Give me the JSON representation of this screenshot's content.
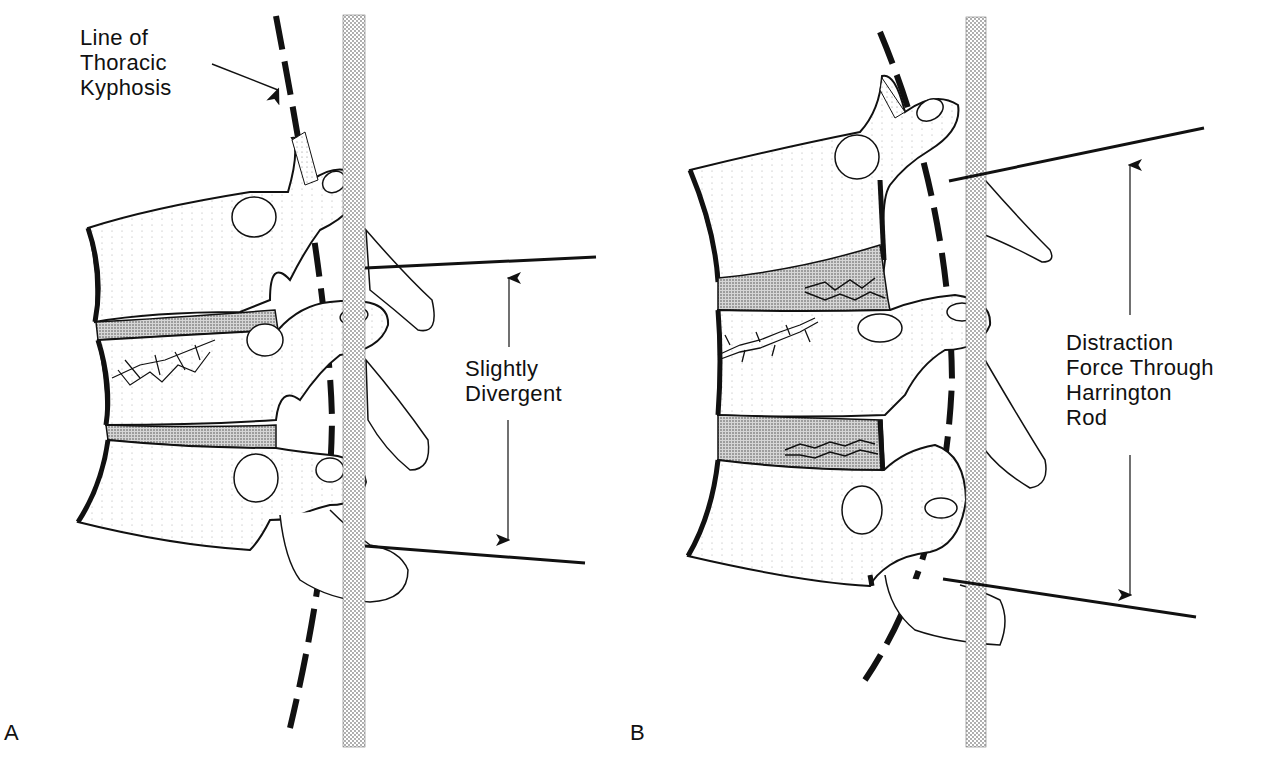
{
  "figure": {
    "panels": [
      {
        "id": "A",
        "letter": "A",
        "annotations": {
          "kyphosis_label": [
            "Line of",
            "Thoracic",
            "Kyphosis"
          ],
          "measure_label": [
            "Slightly",
            "Divergent"
          ]
        }
      },
      {
        "id": "B",
        "letter": "B",
        "annotations": {
          "measure_label": [
            "Distraction",
            "Force Through",
            "Harrington",
            "Rod"
          ]
        }
      }
    ],
    "colors": {
      "ink": "#111111",
      "rod_stipple": "#9a9a9a",
      "disc_stipple": "#6a6a6a",
      "background": "#ffffff"
    }
  }
}
